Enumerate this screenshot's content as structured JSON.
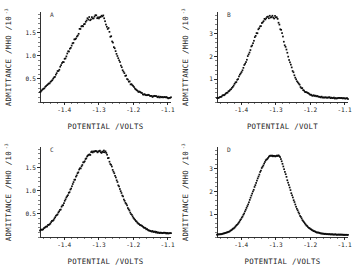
{
  "figure": {
    "background_color": "#ffffff",
    "marker_color": "#0d0d0d",
    "axis_color": "#1c1c1c",
    "layout": "2x2 grid of scatter panels"
  },
  "chart_data": [
    {
      "type": "scatter",
      "panel_label": "A",
      "title": "",
      "xlabel": "POTENTIAL /VOLTS",
      "ylabel": "ADMITTANCE /MHO /10",
      "ylabel_exponent": "-3",
      "xlim": [
        -1.47,
        -1.09
      ],
      "ylim": [
        0.0,
        1.95
      ],
      "xticks": [
        -1.4,
        -1.3,
        -1.2,
        -1.1
      ],
      "xticklabels": [
        "-1.4",
        "-1.3",
        "-1.2",
        "-1.1"
      ],
      "yticks": [
        0.5,
        1.0,
        1.5
      ],
      "yticklabels": [
        "0.5",
        "1.0",
        "1.5"
      ],
      "grid": false,
      "legend": "none",
      "peak_x": -1.312,
      "peak_y": 1.78,
      "baseline": 0.06,
      "width_left": 0.072,
      "width_right": 0.052,
      "tail_right": 0.1,
      "noise": 0.035,
      "n_points": 150
    },
    {
      "type": "scatter",
      "panel_label": "B",
      "title": "",
      "xlabel": "POTENTIAL /VOLT",
      "ylabel": "ADMITTANCE /MHO /10",
      "ylabel_exponent": "-3",
      "xlim": [
        -1.47,
        -1.09
      ],
      "ylim": [
        0.0,
        3.95
      ],
      "xticks": [
        -1.4,
        -1.3,
        -1.2,
        -1.1
      ],
      "xticklabels": [
        "-1.4",
        "-1.3",
        "-1.2",
        "-1.1"
      ],
      "yticks": [
        1,
        2,
        3
      ],
      "yticklabels": [
        "1",
        "2",
        "3"
      ],
      "grid": false,
      "legend": "none",
      "peak_x": -1.318,
      "peak_y": 3.62,
      "baseline": 0.1,
      "width_left": 0.055,
      "width_right": 0.042,
      "tail_right": 0.09,
      "noise": 0.05,
      "n_points": 150
    },
    {
      "type": "scatter",
      "panel_label": "C",
      "title": "",
      "xlabel": "POTENTIAL /VOLTS",
      "ylabel": "ADMITTANCE /MHO /10",
      "ylabel_exponent": "-3",
      "xlim": [
        -1.47,
        -1.09
      ],
      "ylim": [
        0.0,
        1.95
      ],
      "xticks": [
        -1.4,
        -1.3,
        -1.2,
        -1.1
      ],
      "xticklabels": [
        "-1.4",
        "-1.3",
        "-1.2",
        "-1.1"
      ],
      "yticks": [
        0.5,
        1.0,
        1.5
      ],
      "yticklabels": [
        "0.5",
        "1.0",
        "1.5"
      ],
      "grid": false,
      "legend": "none",
      "peak_x": -1.309,
      "peak_y": 1.8,
      "baseline": 0.05,
      "width_left": 0.066,
      "width_right": 0.058,
      "tail_right": 0.085,
      "noise": 0.022,
      "n_points": 165
    },
    {
      "type": "scatter",
      "panel_label": "D",
      "title": "",
      "xlabel": "POTENTIAL /VOLTS",
      "ylabel": "ADMITTANCE /MHO /10",
      "ylabel_exponent": "-3",
      "xlim": [
        -1.47,
        -1.09
      ],
      "ylim": [
        0.0,
        3.95
      ],
      "xticks": [
        -1.4,
        -1.3,
        -1.2,
        -1.1
      ],
      "xticklabels": [
        "-1.4",
        "-1.3",
        "-1.2",
        "-1.1"
      ],
      "yticks": [
        1,
        2,
        3
      ],
      "yticklabels": [
        "1",
        "2",
        "3"
      ],
      "grid": false,
      "legend": "none",
      "peak_x": -1.311,
      "peak_y": 3.48,
      "baseline": 0.08,
      "width_left": 0.05,
      "width_right": 0.046,
      "tail_right": 0.06,
      "noise": 0.02,
      "n_points": 165
    }
  ]
}
